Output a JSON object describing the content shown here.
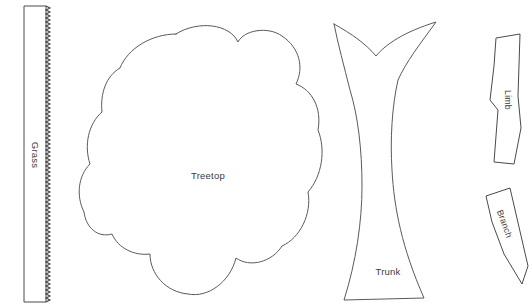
{
  "document": {
    "title": "Tree Craft Cut-Out Template",
    "background_color": "#ffffff",
    "outline_color": "#4a4a4a",
    "label_color": "#3b3b3b",
    "width": 532,
    "height": 308
  },
  "pieces": [
    {
      "id": "grass",
      "label": "Grass",
      "shape": "vertical strip with sawtooth right edge",
      "label_rotation": 90
    },
    {
      "id": "treetop",
      "label": "Treetop",
      "shape": "cloud-like lobed blob",
      "label_rotation": 0
    },
    {
      "id": "trunk",
      "label": "Trunk",
      "shape": "flared forked column",
      "label_rotation": 0
    },
    {
      "id": "limb",
      "label": "Limb",
      "shape": "narrow tapered strip",
      "label_rotation": 90
    },
    {
      "id": "branch",
      "label": "Branch",
      "shape": "slanted tapered wedge",
      "label_rotation": 90
    }
  ]
}
